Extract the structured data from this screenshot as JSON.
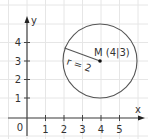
{
  "figure": {
    "type": "coordinate-diagram"
  },
  "axes": {
    "x_label": "x",
    "y_label": "y",
    "origin_label": "0",
    "x_ticks": [
      "1",
      "2",
      "3",
      "4",
      "5"
    ],
    "y_ticks": [
      "1",
      "2",
      "3",
      "4"
    ]
  },
  "circle": {
    "center_label": "M (4|3)",
    "center": {
      "x": 4,
      "y": 3
    },
    "radius": 2,
    "radius_label": "r = 2"
  },
  "colors": {
    "grid": "#e6e6e6",
    "axis": "#444444",
    "circle": "#555555",
    "text": "#333333"
  }
}
